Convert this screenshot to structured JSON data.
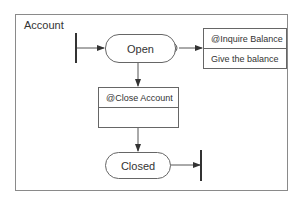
{
  "diagram": {
    "type": "state-machine",
    "container": {
      "label": "Account"
    },
    "states": [
      {
        "id": "open",
        "label": "Open"
      },
      {
        "id": "closed",
        "label": "Closed"
      }
    ],
    "activities": [
      {
        "id": "inquire",
        "title": "@Inquire Balance",
        "body": "Give the balance"
      },
      {
        "id": "close",
        "title": "@Close Account",
        "body": ""
      }
    ],
    "transitions": [
      {
        "from": "start",
        "to": "open"
      },
      {
        "from": "open",
        "to": "inquire"
      },
      {
        "from": "open",
        "to": "close"
      },
      {
        "from": "close",
        "to": "closed"
      },
      {
        "from": "closed",
        "to": "end"
      }
    ],
    "colors": {
      "line": "#555555",
      "frame": "#8a8a8a",
      "text": "#333333"
    }
  }
}
